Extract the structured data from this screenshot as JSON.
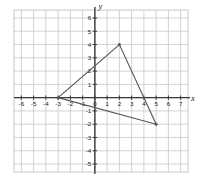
{
  "figure": {
    "name": "coordinate-plane-triangle",
    "background_color": "#ffffff",
    "grid_color": "#c8c8c8",
    "axis_color": "#3a3a3a",
    "shape_color": "#555555",
    "label_color": "#1a1a1a"
  },
  "axes": {
    "x_label": "x",
    "y_label": "y",
    "xlim": [
      -6.6,
      7.6
    ],
    "ylim": [
      -5.6,
      6.6
    ],
    "x_ticks": [
      -6,
      -5,
      -4,
      -3,
      -2,
      -1,
      0,
      1,
      2,
      3,
      4,
      5,
      6,
      7
    ],
    "y_ticks": [
      6,
      5,
      4,
      3,
      2,
      1,
      -1,
      -2,
      -3,
      -4,
      -5
    ],
    "x_tick_labels": [
      "-6",
      "-5",
      "-4",
      "-3",
      "-2",
      "-1",
      "0",
      "1",
      "2",
      "3",
      "4",
      "5",
      "6",
      "7"
    ],
    "y_tick_labels": [
      "6",
      "5",
      "4",
      "3",
      "2",
      "1",
      "-1",
      "-2",
      "-3",
      "-4",
      "-5"
    ],
    "origin_label": "0",
    "grid": true,
    "grid_spacing": 1
  },
  "chart_data": {
    "type": "scatter",
    "title": "",
    "xlabel": "x",
    "ylabel": "y",
    "xlim": [
      -6.6,
      7.6
    ],
    "ylim": [
      -5.6,
      6.6
    ],
    "grid": true,
    "legend": "none",
    "series": [
      {
        "name": "triangle",
        "kind": "polygon",
        "closed": true,
        "points": [
          {
            "x": -3,
            "y": 0,
            "label": "vertex-left"
          },
          {
            "x": 2,
            "y": 4,
            "label": "vertex-top"
          },
          {
            "x": 5,
            "y": -2,
            "label": "vertex-right"
          }
        ],
        "vertex_markers": true
      }
    ]
  }
}
